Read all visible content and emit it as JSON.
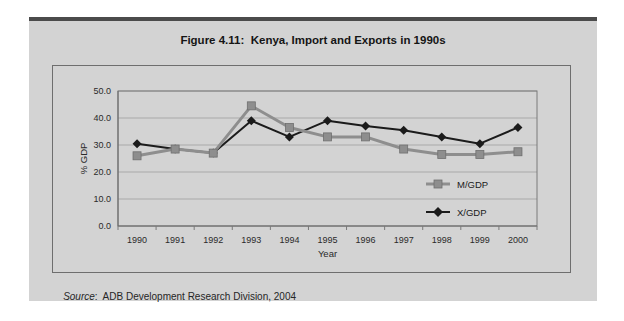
{
  "figure": {
    "title": "Figure 4.11:  Kenya, Import and Exports in 1990s",
    "source": {
      "label": "Source",
      "text": ":  ADB Development Research Division, 2004"
    }
  },
  "chart_data": {
    "type": "line",
    "title": "Figure 4.11: Kenya, Import and Exports in 1990s",
    "categories": [
      "1990",
      "1991",
      "1992",
      "1993",
      "1994",
      "1995",
      "1996",
      "1997",
      "1998",
      "1999",
      "2000"
    ],
    "series": [
      {
        "name": "M/GDP",
        "marker": "square",
        "color": "#8e8e8e",
        "values": [
          26.0,
          28.5,
          27.0,
          44.5,
          36.5,
          33.0,
          33.0,
          28.5,
          26.5,
          26.5,
          27.5
        ]
      },
      {
        "name": "X/GDP",
        "marker": "diamond",
        "color": "#1b1b1b",
        "values": [
          30.5,
          28.5,
          27.0,
          39.0,
          33.0,
          39.0,
          37.0,
          35.5,
          33.0,
          30.5,
          36.5
        ]
      }
    ],
    "xlabel": "Year",
    "ylabel": "% GDP",
    "ylim": [
      0,
      50
    ],
    "ytick_step": 10,
    "ytick_labels": [
      "0.0",
      "10.0",
      "20.0",
      "30.0",
      "40.0",
      "50.0"
    ],
    "grid": "horizontal",
    "legend_position": "inside-bottom-right"
  },
  "colors": {
    "page_bg": "#ffffff",
    "card_bg": "#d3d3d3",
    "top_bar": "#4b4b4b",
    "frame_border": "#6e6e6e",
    "gridline": "#a9a9a9",
    "axis": "#7a7a7a",
    "text": "#2a2a2a"
  }
}
